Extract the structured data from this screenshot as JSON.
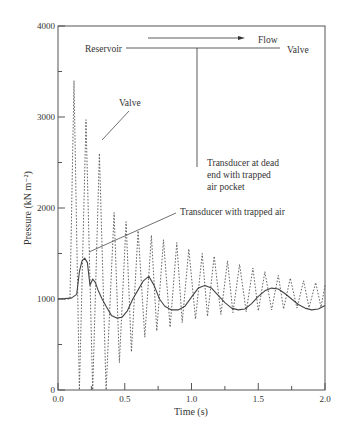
{
  "chart_data": {
    "type": "line",
    "title": "",
    "xlabel": "Time (s)",
    "ylabel": "Pressure (kN m⁻²)",
    "xlim": [
      0.0,
      2.0
    ],
    "ylim": [
      0,
      4000
    ],
    "x_ticks": [
      0.0,
      0.5,
      1.0,
      1.5,
      2.0
    ],
    "x_tick_labels": [
      "0.0",
      "0.5",
      "1.0",
      "1.5",
      "2.0"
    ],
    "x_minor_ticks": [
      0.25,
      0.75,
      1.25,
      1.75
    ],
    "y_ticks": [
      0,
      1000,
      2000,
      3000,
      4000
    ],
    "y_tick_labels": [
      "0",
      "1000",
      "2000",
      "3000",
      "4000"
    ],
    "y_minor_ticks": [
      500,
      1500,
      2500,
      3500
    ],
    "grid": false,
    "legend": null,
    "series": [
      {
        "name": "Transducer at dead end with trapped air pocket",
        "style": "dotted",
        "description": "Rapid oscillation; peaks decay from ~3400 toward ~1000, troughs rise from 0 toward ~850",
        "peaks": [
          {
            "t": 0.12,
            "p": 3400
          },
          {
            "t": 0.21,
            "p": 2970
          },
          {
            "t": 0.31,
            "p": 2600
          },
          {
            "t": 0.42,
            "p": 1950
          },
          {
            "t": 0.51,
            "p": 1850
          },
          {
            "t": 0.6,
            "p": 1750
          },
          {
            "t": 0.7,
            "p": 1700
          },
          {
            "t": 0.79,
            "p": 1650
          },
          {
            "t": 0.89,
            "p": 1620
          },
          {
            "t": 0.98,
            "p": 1550
          },
          {
            "t": 1.08,
            "p": 1500
          },
          {
            "t": 1.17,
            "p": 1470
          },
          {
            "t": 1.27,
            "p": 1420
          },
          {
            "t": 1.36,
            "p": 1380
          },
          {
            "t": 1.46,
            "p": 1340
          },
          {
            "t": 1.55,
            "p": 1300
          },
          {
            "t": 1.65,
            "p": 1260
          },
          {
            "t": 1.74,
            "p": 1230
          },
          {
            "t": 1.84,
            "p": 1200
          },
          {
            "t": 1.93,
            "p": 1180
          },
          {
            "t": 2.0,
            "p": 1150
          }
        ],
        "troughs": [
          {
            "t": 0.16,
            "p": 0
          },
          {
            "t": 0.26,
            "p": 0
          },
          {
            "t": 0.36,
            "p": 0
          },
          {
            "t": 0.46,
            "p": 300
          },
          {
            "t": 0.55,
            "p": 420
          },
          {
            "t": 0.65,
            "p": 580
          },
          {
            "t": 0.74,
            "p": 650
          },
          {
            "t": 0.84,
            "p": 690
          },
          {
            "t": 0.93,
            "p": 740
          },
          {
            "t": 1.03,
            "p": 780
          },
          {
            "t": 1.12,
            "p": 810
          },
          {
            "t": 1.22,
            "p": 830
          },
          {
            "t": 1.31,
            "p": 850
          },
          {
            "t": 1.41,
            "p": 860
          },
          {
            "t": 1.5,
            "p": 870
          },
          {
            "t": 1.6,
            "p": 880
          },
          {
            "t": 1.69,
            "p": 890
          },
          {
            "t": 1.79,
            "p": 900
          },
          {
            "t": 1.88,
            "p": 905
          },
          {
            "t": 1.97,
            "p": 910
          }
        ],
        "pre_event": [
          {
            "t": 0.0,
            "p": 1000
          },
          {
            "t": 0.09,
            "p": 1000
          }
        ]
      },
      {
        "name": "Transducer with trapped air",
        "style": "solid",
        "x": [
          0.0,
          0.1,
          0.14,
          0.16,
          0.18,
          0.2,
          0.22,
          0.24,
          0.26,
          0.28,
          0.3,
          0.33,
          0.36,
          0.4,
          0.44,
          0.48,
          0.52,
          0.56,
          0.6,
          0.64,
          0.68,
          0.72,
          0.76,
          0.8,
          0.85,
          0.9,
          0.95,
          1.0,
          1.05,
          1.1,
          1.15,
          1.2,
          1.25,
          1.3,
          1.35,
          1.4,
          1.45,
          1.5,
          1.55,
          1.6,
          1.65,
          1.7,
          1.75,
          1.8,
          1.85,
          1.9,
          1.95,
          2.0
        ],
        "y": [
          1000,
          1010,
          1050,
          1300,
          1420,
          1450,
          1400,
          1150,
          1220,
          1180,
          1100,
          1000,
          920,
          820,
          790,
          800,
          870,
          1000,
          1100,
          1200,
          1250,
          1150,
          1000,
          920,
          880,
          880,
          920,
          1020,
          1120,
          1150,
          1120,
          1040,
          960,
          900,
          880,
          890,
          950,
          1030,
          1090,
          1120,
          1110,
          1060,
          1000,
          940,
          900,
          880,
          890,
          930
        ]
      }
    ],
    "annotations": [
      {
        "text": "Valve",
        "x": 0.43,
        "y": 3100,
        "pointer_to": {
          "x": 0.32,
          "y": 2430
        }
      },
      {
        "text": "Transducer at dead end with trapped air pocket",
        "lines": [
          "Transducer at dead",
          "end with trapped",
          "air pocket"
        ]
      },
      {
        "text": "Transducer with trapped air",
        "pointer_to": {
          "x": 0.22,
          "y": 1530
        }
      }
    ],
    "inset_diagram": {
      "flow_label": "Flow",
      "reservoir_label": "Reservoir",
      "valve_label": "Valve",
      "description": "Horizontal pipe from Reservoir to Valve with a vertical dead-end branch; arrow pointing right labeled Flow"
    }
  }
}
